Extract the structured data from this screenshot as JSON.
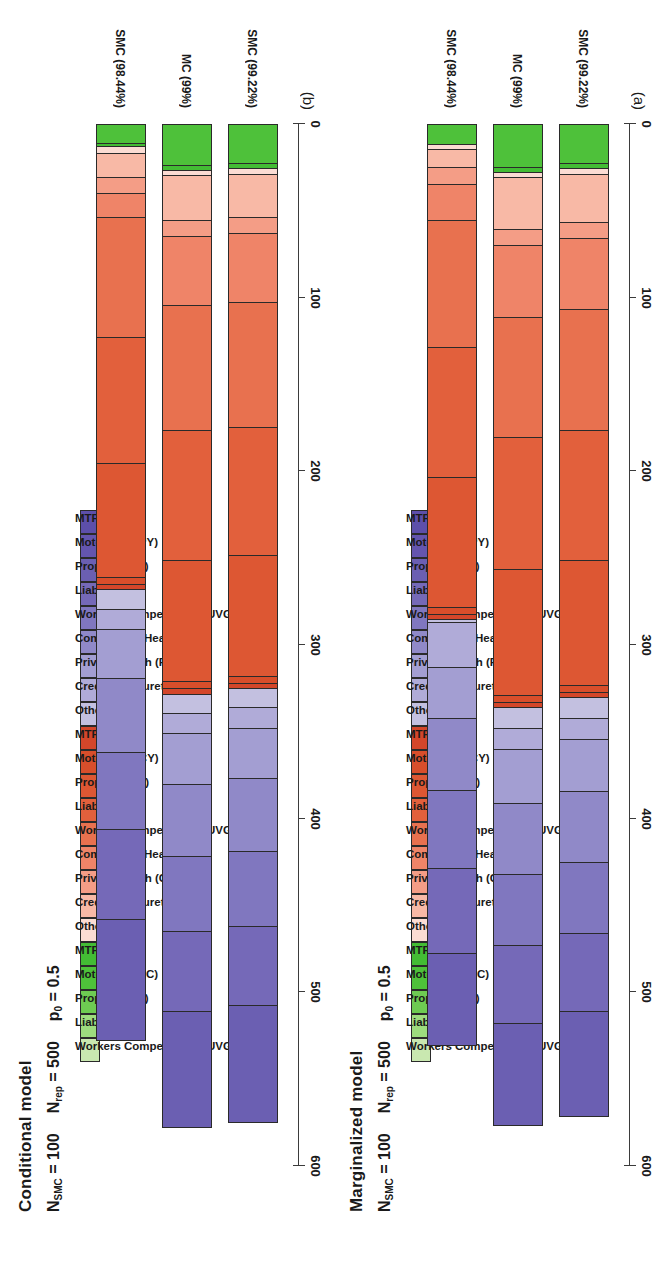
{
  "figure": {
    "panels": [
      {
        "id": "panel-b",
        "caption": "(b)",
        "title": "Conditional model",
        "params": {
          "n_smc_label": "N",
          "n_smc_sub": "SMC",
          "n_smc_eq": "= 100",
          "n_rep_label": "N",
          "n_rep_sub": "rep",
          "n_rep_eq": "= 500",
          "p0_label": "p",
          "p0_sub": "0",
          "p0_eq": "= 0.5"
        }
      },
      {
        "id": "panel-a",
        "caption": "(a)",
        "title": "Marginalized model",
        "params": {
          "n_smc_label": "N",
          "n_smc_sub": "SMC",
          "n_smc_eq": "= 100",
          "n_rep_label": "N",
          "n_rep_sub": "rep",
          "n_rep_eq": "= 500",
          "p0_label": "p",
          "p0_sub": "0",
          "p0_eq": "= 0.5"
        }
      }
    ],
    "axis": {
      "ticks": [
        "600",
        "500",
        "400",
        "300",
        "200",
        "100",
        "0"
      ],
      "min": 0,
      "max": 600,
      "reversed": true
    },
    "group_labels": [
      "SMC (98.44%)",
      "MC (99%)",
      "SMC (99.22%)"
    ],
    "legend_labels": [
      "Workers Compensation UVG (LC)",
      "Liability (LC)",
      "Property (LC)",
      "Motor Hull (LC)",
      "MTPL (LC)",
      "Others (CY)",
      "Credit and Surety (CY)",
      "Private Health (CY)",
      "Commercial Health (CY)",
      "Workers Compensation UVG (CY)",
      "Liability (CY)",
      "Property (CY)",
      "Motor Hull (CY)",
      "MTPL (CY)",
      "Others (PY)",
      "Credit and Surety (PY)",
      "Private Health (PY)",
      "Commercial Health (PY)",
      "Workers Compensation UVG (PY)",
      "Liability (PY)",
      "Property (PY)",
      "Motor Hull (PY)",
      "MTPL (PY)"
    ],
    "legend_colors": [
      "#c9e8b0",
      "#9ddc7e",
      "#6ecb52",
      "#4ec13a",
      "#43bc34",
      "#fbdcd3",
      "#f8b9a6",
      "#f49d86",
      "#ef8468",
      "#e8714f",
      "#e2603c",
      "#dd5733",
      "#d84e2b",
      "#d3462a",
      "#c3c0e0",
      "#b0abd8",
      "#a39ed2",
      "#9089c8",
      "#8077bf",
      "#7569b8",
      "#6b5fb2",
      "#6455ae",
      "#5d4faa"
    ]
  },
  "chart_data": {
    "type": "bar",
    "xlabel": "",
    "ylabel": "",
    "ylim": [
      0,
      600
    ],
    "orientation": "horizontal-stacked",
    "categories": [
      "SMC (98.44%)",
      "MC (99%)",
      "SMC (99.22%)"
    ],
    "series_names": [
      "Workers Compensation UVG (LC)",
      "Liability (LC)",
      "Property (LC)",
      "Motor Hull (LC)",
      "MTPL (LC)",
      "Others (CY)",
      "Credit and Surety (CY)",
      "Private Health (CY)",
      "Commercial Health (CY)",
      "Workers Compensation UVG (CY)",
      "Liability (CY)",
      "Property (CY)",
      "Motor Hull (CY)",
      "MTPL (CY)",
      "Others (PY)",
      "Credit and Surety (PY)",
      "Private Health (PY)",
      "Commercial Health (PY)",
      "Workers Compensation UVG (PY)",
      "Liability (PY)",
      "Property (PY)",
      "Motor Hull (PY)",
      "MTPL (PY)"
    ],
    "panels": [
      {
        "caption": "(a)",
        "title": "Marginalized model",
        "totals": [
          531,
          577,
          572
        ],
        "stacks": [
          [
            0,
            0,
            0,
            11,
            0,
            3,
            10,
            10,
            21,
            73,
            75,
            75,
            4,
            3,
            2,
            26,
            29,
            42,
            45,
            49,
            53,
            0,
            0
          ],
          [
            0,
            0,
            0,
            24,
            3,
            3,
            30,
            9,
            42,
            69,
            76,
            73,
            4,
            3,
            12,
            12,
            31,
            41,
            41,
            45,
            59,
            0,
            0
          ],
          [
            0,
            0,
            0,
            22,
            3,
            3,
            28,
            9,
            41,
            70,
            75,
            72,
            4,
            3,
            12,
            12,
            30,
            41,
            41,
            45,
            61,
            0,
            0
          ]
        ]
      },
      {
        "caption": "(b)",
        "title": "Conditional model",
        "totals": [
          528,
          578,
          575
        ],
        "stacks": [
          [
            0,
            0,
            0,
            10,
            2,
            4,
            14,
            9,
            14,
            69,
            73,
            66,
            4,
            3,
            11,
            12,
            28,
            43,
            44,
            52,
            70,
            0,
            0
          ],
          [
            0,
            0,
            0,
            23,
            3,
            3,
            26,
            9,
            40,
            72,
            75,
            70,
            4,
            3,
            11,
            12,
            29,
            42,
            43,
            46,
            67,
            0,
            0
          ],
          [
            0,
            0,
            0,
            22,
            3,
            3,
            25,
            9,
            40,
            72,
            74,
            70,
            4,
            3,
            11,
            12,
            29,
            42,
            43,
            46,
            67,
            0,
            0
          ]
        ]
      }
    ]
  }
}
